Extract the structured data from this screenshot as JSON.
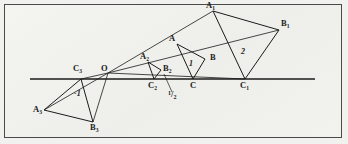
{
  "figure": {
    "background_color": "#f1f1ed",
    "ink_color": "#1b1b1b",
    "frame_color": "#4a4a4a",
    "axis": {
      "name": "horizontal-line",
      "y": 79,
      "x_start": 30,
      "x_end": 315
    },
    "center": {
      "label": "O",
      "x": 108,
      "y": 73
    },
    "points": [
      {
        "id": "O",
        "label": "O",
        "sub": "",
        "x": 108,
        "y": 73,
        "label_x": 101,
        "label_y": 66
      },
      {
        "id": "A",
        "label": "A",
        "sub": "",
        "x": 177,
        "y": 44,
        "label_x": 169,
        "label_y": 36
      },
      {
        "id": "B",
        "label": "B",
        "sub": "",
        "x": 205,
        "y": 59,
        "label_x": 210,
        "label_y": 55
      },
      {
        "id": "C",
        "label": "C",
        "sub": "",
        "x": 193,
        "y": 79,
        "label_x": 190,
        "label_y": 82
      },
      {
        "id": "A1",
        "label": "A",
        "sub": "1",
        "x": 213,
        "y": 11,
        "label_x": 207,
        "label_y": 3
      },
      {
        "id": "B1",
        "label": "B",
        "sub": "1",
        "x": 279,
        "y": 30,
        "label_x": 281,
        "label_y": 21
      },
      {
        "id": "C1",
        "label": "C",
        "sub": "1",
        "x": 245,
        "y": 79,
        "label_x": 241,
        "label_y": 82
      },
      {
        "id": "A2",
        "label": "A",
        "sub": "2",
        "x": 148,
        "y": 62,
        "label_x": 141,
        "label_y": 54
      },
      {
        "id": "B2",
        "label": "B",
        "sub": "2",
        "x": 161,
        "y": 70,
        "label_x": 163,
        "label_y": 66
      },
      {
        "id": "C2",
        "label": "C",
        "sub": "2",
        "x": 154,
        "y": 79,
        "label_x": 149,
        "label_y": 82
      },
      {
        "id": "A3",
        "label": "A",
        "sub": "3",
        "x": 44,
        "y": 110,
        "label_x": 35,
        "label_y": 107
      },
      {
        "id": "B3",
        "label": "B",
        "sub": "3",
        "x": 93,
        "y": 122,
        "label_x": 91,
        "label_y": 124
      },
      {
        "id": "C3",
        "label": "C",
        "sub": "3",
        "x": 81,
        "y": 79,
        "label_x": 74,
        "label_y": 66
      }
    ],
    "ratio_labels": [
      {
        "id": "ratio-2",
        "text": "2",
        "x": 243,
        "y": 52
      },
      {
        "id": "ratio-1",
        "text": "1",
        "x": 190,
        "y": 64
      },
      {
        "id": "ratio-minus-one",
        "text": "-1",
        "x": 78,
        "y": 94
      }
    ],
    "fraction_label": {
      "id": "ratio-one-half",
      "numerator": "1",
      "slash": "/",
      "denominator": "2",
      "x": 171,
      "y": 94,
      "leader_from_x": 164,
      "leader_from_y": 74,
      "leader_to_x": 172,
      "leader_to_y": 92
    },
    "triangles": [
      {
        "id": "triangle-image-2",
        "ratio": "2",
        "vertices": [
          "A1",
          "B1",
          "C1"
        ]
      },
      {
        "id": "triangle-original",
        "ratio": "1",
        "vertices": [
          "A",
          "B",
          "C"
        ]
      },
      {
        "id": "triangle-image-half",
        "ratio": "1/2",
        "vertices": [
          "A2",
          "B2",
          "C2"
        ]
      },
      {
        "id": "triangle-image-minus-1",
        "ratio": "-1",
        "vertices": [
          "A3",
          "B3",
          "C3"
        ]
      }
    ],
    "rays": [
      {
        "id": "ray-O-A1",
        "from": "O",
        "to": "A1"
      },
      {
        "id": "ray-O-B1",
        "from": "O",
        "to": "B1"
      },
      {
        "id": "ray-O-C1",
        "from": "O",
        "to": "C1"
      },
      {
        "id": "ray-O-A3",
        "from": "O",
        "to": "A3"
      },
      {
        "id": "ray-O-B3",
        "from": "O",
        "to": "B3"
      },
      {
        "id": "ray-O-C3",
        "from": "O",
        "to": "C3"
      }
    ]
  }
}
